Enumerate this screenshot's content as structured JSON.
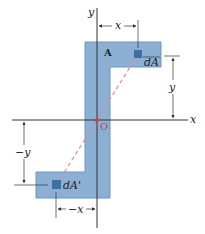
{
  "figure": {
    "colors": {
      "area_fill": "#8bb0d4",
      "area_stroke": "#6f95bb",
      "element_fill": "#3d6fa6",
      "axis": "#333333",
      "dashed_line": "#e08a96",
      "origin": "#d9383f"
    },
    "labels": {
      "y_axis": "y",
      "x_axis": "x",
      "area": "A",
      "origin": "O",
      "element_upper": "dA",
      "element_lower": "dA'",
      "dim_x_upper": "x",
      "dim_y_upper": "y",
      "dim_x_lower": "−x",
      "dim_y_lower": "−y"
    }
  }
}
